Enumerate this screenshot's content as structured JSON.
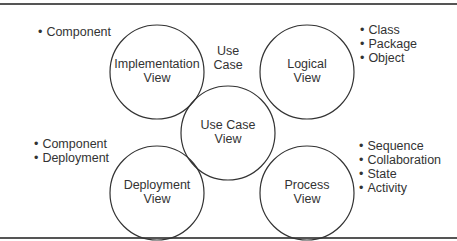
{
  "views": [
    {
      "id": "implementation",
      "line1": "Implementation",
      "line2": "View"
    },
    {
      "id": "logical",
      "line1": "Logical",
      "line2": "View"
    },
    {
      "id": "usecase",
      "line1": "Use Case",
      "line2": "View"
    },
    {
      "id": "deployment",
      "line1": "Deployment",
      "line2": "View"
    },
    {
      "id": "process",
      "line1": "Process",
      "line2": "View"
    }
  ],
  "usecase_label": {
    "line1": "Use",
    "line2": "Case"
  },
  "lists": {
    "implementation": [
      "Component"
    ],
    "logical": [
      "Class",
      "Package",
      "Object"
    ],
    "deployment": [
      "Component",
      "Deployment"
    ],
    "process": [
      "Sequence",
      "Collaboration",
      "State",
      "Activity"
    ]
  }
}
